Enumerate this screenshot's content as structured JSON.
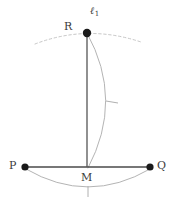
{
  "diagram": {
    "width": 173,
    "height": 203,
    "background_color": "#ffffff",
    "labels": {
      "point_R": "R",
      "point_P": "P",
      "point_Q": "Q",
      "point_M": "M",
      "line_l1": "ℓ",
      "line_l1_subscript": "1"
    },
    "colors": {
      "point_fill": "#1a1a1a",
      "segment_stroke": "#4a4a4a",
      "vertical_stroke": "#555555",
      "arc_stroke": "#b4b4b4",
      "dotted_arc_stroke": "#c8c8c8",
      "tick_stroke": "#b0b0b0",
      "label_text": "#3b3b3b"
    },
    "points": [
      {
        "name": "R",
        "x": 87,
        "y": 33,
        "radius": 4.2
      },
      {
        "name": "P",
        "x": 25,
        "y": 167,
        "radius": 3.6
      },
      {
        "name": "Q",
        "x": 150,
        "y": 167,
        "radius": 3.6
      },
      {
        "name": "M",
        "x": 87,
        "y": 167,
        "radius": 0
      }
    ],
    "segments": [
      {
        "name": "segment-PQ",
        "x1": 25,
        "y1": 167,
        "x2": 150,
        "y2": 167
      },
      {
        "name": "segment-RM",
        "x1": 87,
        "y1": 33,
        "x2": 87,
        "y2": 167
      }
    ],
    "arcs": [
      {
        "name": "arc-through-R-dotted",
        "path": "M 35 44 Q 87 24 141 42",
        "style": "dotted"
      },
      {
        "name": "arc-R-to-M-right",
        "path": "M 87 33 Q 124 100 88 168",
        "style": "solid"
      },
      {
        "name": "arc-P-to-Q-below",
        "path": "M 26 169 Q 88 205 150 169",
        "style": "solid"
      }
    ],
    "tick_marks": [
      {
        "name": "tick-on-arc-RM",
        "x": 112,
        "y": 102,
        "angle": 8
      },
      {
        "name": "tick-on-arc-PQ",
        "x": 88,
        "y": 192,
        "angle": 92
      }
    ]
  }
}
